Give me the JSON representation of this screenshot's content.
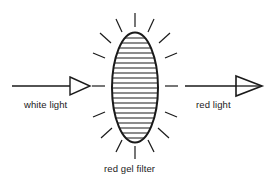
{
  "figure": {
    "background_color": "#ffffff",
    "stroke_color": "#1a1a1a",
    "text_color": "#1a1a1a",
    "width": 272,
    "height": 183
  },
  "labels": {
    "white_light": "white light",
    "red_light": "red light",
    "red_gel_filter": "red gel filter"
  },
  "elements": {
    "incoming_beam": {
      "name": "white light beam",
      "arrow_style": "open outlined triangle head",
      "direction": "left to right"
    },
    "filter": {
      "name": "red gel filter",
      "shape": "vertical ellipse with horizontal hatch lines",
      "hatch_line_count": 21,
      "ray_count": 12
    },
    "outgoing_beam": {
      "name": "red light beam",
      "arrow_style": "outlined triangle head with shaft through it",
      "direction": "left to right"
    }
  }
}
